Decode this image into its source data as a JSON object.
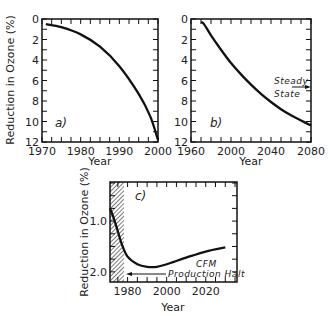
{
  "chart_data": [
    {
      "type": "line",
      "panel": "a)",
      "title": "",
      "xlabel": "Year",
      "ylabel": "Reduction in Ozone (%)",
      "xlim": [
        1970,
        2000
      ],
      "ylim": [
        0,
        12
      ],
      "y_inverted": true,
      "xticks": [
        "1970",
        "1980",
        "1990",
        "2000"
      ],
      "yticks": [
        "0",
        "2",
        "4",
        "6",
        "8",
        "10",
        "12"
      ],
      "grid": false,
      "series": [
        {
          "name": "ozone reduction",
          "x": [
            1971,
            1975,
            1980,
            1985,
            1990,
            1995,
            1998,
            2000
          ],
          "y": [
            0.5,
            0.8,
            1.5,
            2.7,
            4.6,
            7.3,
            9.5,
            11.8
          ]
        }
      ]
    },
    {
      "type": "line",
      "panel": "b)",
      "title": "",
      "xlabel": "Year",
      "ylabel": "",
      "xlim": [
        1960,
        2080
      ],
      "ylim": [
        0,
        12
      ],
      "y_inverted": true,
      "xticks": [
        "1960",
        "2000",
        "2040",
        "2080"
      ],
      "yticks": [
        "0",
        "2",
        "4",
        "6",
        "8",
        "10",
        "12"
      ],
      "grid": false,
      "annotations": [
        {
          "text": "Steady State",
          "x": 2080,
          "y": 6.7,
          "arrow": "right"
        }
      ],
      "series": [
        {
          "name": "ozone reduction",
          "x": [
            1970,
            1973,
            1980,
            1990,
            2000,
            2010,
            2020,
            2030,
            2040,
            2050,
            2060,
            2070,
            2080
          ],
          "y": [
            0.3,
            0.5,
            1.6,
            3.0,
            4.3,
            5.4,
            6.4,
            7.3,
            8.1,
            8.8,
            9.4,
            9.9,
            10.4
          ]
        }
      ]
    },
    {
      "type": "line",
      "panel": "c)",
      "title": "",
      "xlabel": "Year",
      "ylabel": "Reduction in Ozone (%)",
      "xlim": [
        1971,
        2036
      ],
      "ylim": [
        0.23,
        2.2
      ],
      "y_inverted": true,
      "xticks": [
        "1980",
        "2000",
        "2020"
      ],
      "yticks": [
        "1.0",
        "2.0"
      ],
      "grid": false,
      "shaded_region": {
        "x": [
          1971,
          1978
        ],
        "pattern": "hatched"
      },
      "annotations": [
        {
          "text": "CFM Production Halt",
          "x_from": 2000,
          "x_to": 1978,
          "y": 2.0,
          "arrow": "left"
        }
      ],
      "series": [
        {
          "name": "ozone reduction",
          "x": [
            1971,
            1973,
            1975,
            1977,
            1980,
            1985,
            1990,
            1995,
            2000,
            2010,
            2020,
            2030
          ],
          "y": [
            0.75,
            0.95,
            1.2,
            1.45,
            1.7,
            1.85,
            1.9,
            1.9,
            1.85,
            1.72,
            1.6,
            1.52
          ]
        }
      ]
    }
  ],
  "labels": {
    "a_panel": "a)",
    "b_panel": "b)",
    "c_panel": "c)",
    "ylabel": "Reduction in Ozone (%)",
    "xlabel": "Year",
    "steady": "Steady",
    "state": "State",
    "cfm": "CFM",
    "production_halt": "Production Halt",
    "a_xticks": [
      "1970",
      "1980",
      "1990",
      "2000"
    ],
    "b_xticks": [
      "1960",
      "2000",
      "2040",
      "2080"
    ],
    "ab_yticks": [
      "0",
      "2",
      "4",
      "6",
      "8",
      "10",
      "12"
    ],
    "c_xticks": [
      "1980",
      "2000",
      "2020"
    ],
    "c_yticks": [
      "1.0",
      "2.0"
    ]
  }
}
